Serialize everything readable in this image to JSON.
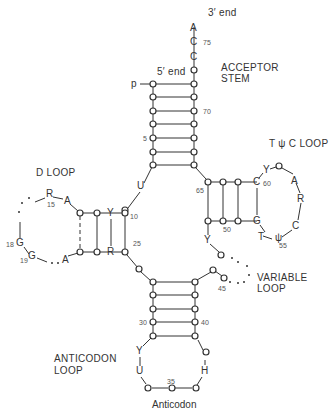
{
  "title_labels": {
    "three_prime_end": "3′ end",
    "five_prime_end": "5′ end",
    "acceptor_stem_line1": "ACCEPTOR",
    "acceptor_stem_line2": "STEM",
    "d_loop": "D LOOP",
    "tpsic_loop": "T ψ C LOOP",
    "variable_loop_line1": "VARIABLE",
    "variable_loop_line2": "LOOP",
    "anticodon_loop_line1": "ANTICODON",
    "anticodon_loop_line2": "LOOP",
    "anticodon": "Anticodon",
    "phosphate": "p"
  },
  "acceptor_end": {
    "bases": [
      "A",
      "C",
      "C"
    ],
    "numbers": {
      "n75": "75",
      "n70": "70",
      "n5": "5"
    }
  },
  "d_arm": {
    "top_strand": [
      "Y"
    ],
    "bottom_strand": [
      "R"
    ],
    "loop_bases": [
      "R",
      "A",
      "G",
      "G",
      "A"
    ],
    "numbers": {
      "n10": "10",
      "n15": "15",
      "n18": "18",
      "n19": "19",
      "n25": "25"
    },
    "linker": "U"
  },
  "t_arm": {
    "top_strand": [
      "C"
    ],
    "bottom_strand": [
      "G"
    ],
    "loop_bases": [
      "Y",
      "A",
      "R",
      "C",
      "ψ",
      "T"
    ],
    "numbers": {
      "n65": "65",
      "n60": "60",
      "n55": "55",
      "n50": "50"
    },
    "linker": "Y"
  },
  "variable_loop": {
    "numbers": {
      "n45": "45"
    }
  },
  "anticodon_arm": {
    "loop_bases": [
      "Y",
      "U",
      "H"
    ],
    "numbers": {
      "n30": "30",
      "n40": "40",
      "n35": "35"
    }
  }
}
